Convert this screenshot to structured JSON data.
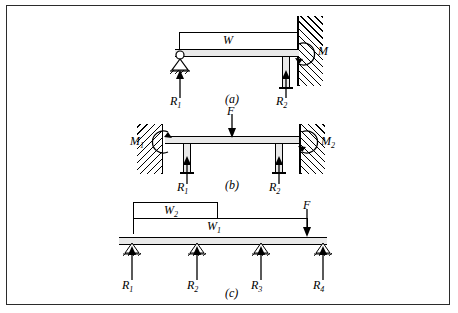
{
  "figure": {
    "title_parts": [
      "(a)",
      "(b)",
      "(c)"
    ],
    "panel_a": {
      "caption": "(a)",
      "span_label": "W",
      "moment_label": "M",
      "reactions": [
        "R",
        "R"
      ],
      "reaction_subs": [
        "1",
        "2"
      ],
      "reaction_labels": [
        "R1",
        "R2"
      ]
    },
    "panel_b": {
      "caption": "(b)",
      "load_label": "F",
      "moment_left": "M",
      "moment_left_sub": "1",
      "moment_right": "M",
      "moment_right_sub": "2",
      "reaction_labels": [
        "R1",
        "R2"
      ],
      "reaction_base": "R",
      "reaction_subs": [
        "1",
        "2"
      ]
    },
    "panel_c": {
      "caption": "(c)",
      "span_upper": "W",
      "span_upper_sub": "2",
      "span_lower": "W",
      "span_lower_sub": "1",
      "load_label": "F",
      "reaction_base": "R",
      "reaction_subs": [
        "1",
        "2",
        "3",
        "4"
      ],
      "reaction_labels": [
        "R1",
        "R2",
        "R3",
        "R4"
      ]
    }
  },
  "colors": {
    "ink": "#000000",
    "beam_fill": "#e9e9e9",
    "border": "#2b2b2b",
    "page": "#ffffff"
  }
}
